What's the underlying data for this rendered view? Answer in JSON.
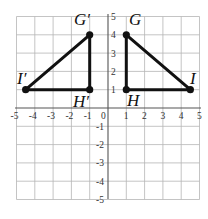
{
  "diagram": {
    "type": "coordinate_plane",
    "x_range": [
      -5,
      5
    ],
    "y_range": [
      -5,
      5
    ],
    "x_ticks": [
      "-5",
      "-4",
      "-3",
      "-2",
      "-1",
      "0",
      "1",
      "2",
      "3",
      "4",
      "5"
    ],
    "y_ticks": [
      "5",
      "4",
      "3",
      "2",
      "1",
      "-1",
      "-2",
      "-3",
      "-4",
      "-5"
    ],
    "origin_label": "0",
    "grid": true
  },
  "triangles": [
    {
      "name": "GHI",
      "points": [
        {
          "label": "G",
          "x": 1,
          "y": 4
        },
        {
          "label": "H",
          "x": 1,
          "y": 1
        },
        {
          "label": "I",
          "x": 4.5,
          "y": 1
        }
      ]
    },
    {
      "name": "G'H'I'",
      "points": [
        {
          "label": "G′",
          "x": -1,
          "y": 4
        },
        {
          "label": "H′",
          "x": -1,
          "y": 1
        },
        {
          "label": "I′",
          "x": -4.5,
          "y": 1
        }
      ]
    }
  ],
  "labels": {
    "G": "G",
    "H": "H",
    "I": "I",
    "Gp": "G′",
    "Hp": "H′",
    "Ip": "I′"
  },
  "colors": {
    "grid": "#b5b5b5",
    "axis": "#555555",
    "shape": "#111111"
  }
}
